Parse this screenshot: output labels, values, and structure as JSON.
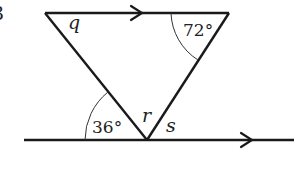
{
  "diagram": {
    "question_number": "3",
    "labels": {
      "q": "q",
      "r": "r",
      "s": "s",
      "angle_top_right": "72°",
      "angle_bottom_left": "36°"
    },
    "colors": {
      "line": "#1a1a1a",
      "text": "#222222",
      "background": "#ffffff"
    }
  }
}
